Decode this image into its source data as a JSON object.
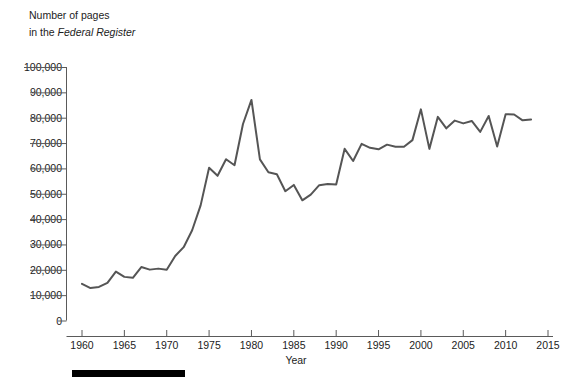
{
  "title": {
    "line1": "Number of pages",
    "line2_prefix": "in the ",
    "line2_italic": "Federal Register"
  },
  "axes": {
    "x_label": "Year",
    "x_ticks": [
      "1960",
      "1965",
      "1970",
      "1975",
      "1980",
      "1985",
      "1990",
      "1995",
      "2000",
      "2005",
      "2010",
      "2015"
    ],
    "y_ticks": [
      "100,000",
      "90,000",
      "80,000",
      "70,000",
      "60,000",
      "50,000",
      "40,000",
      "30,000",
      "20,000",
      "10,000",
      "0"
    ]
  },
  "colors": {
    "line": "#555555",
    "axis": "#5a5a5a",
    "text": "#1c1c1c",
    "rule_bar": "#000000",
    "background": "#ffffff"
  },
  "chart_data": {
    "type": "line",
    "title": "Number of pages in the Federal Register",
    "xlabel": "Year",
    "ylabel": "Number of pages in the Federal Register",
    "xlim": [
      1958.5,
      2015
    ],
    "ylim": [
      0,
      100000
    ],
    "grid": false,
    "legend": "none",
    "x": [
      1960,
      1961,
      1962,
      1963,
      1964,
      1965,
      1966,
      1967,
      1968,
      1969,
      1970,
      1971,
      1972,
      1973,
      1974,
      1975,
      1976,
      1977,
      1978,
      1979,
      1980,
      1981,
      1982,
      1983,
      1984,
      1985,
      1986,
      1987,
      1988,
      1989,
      1990,
      1991,
      1992,
      1993,
      1994,
      1995,
      1996,
      1997,
      1998,
      1999,
      2000,
      2001,
      2002,
      2003,
      2004,
      2005,
      2006,
      2007,
      2008,
      2009,
      2010,
      2011,
      2012,
      2013
    ],
    "series": [
      {
        "name": "Pages in the Federal Register",
        "values": [
          14479,
          12792,
          13226,
          14842,
          19304,
          17206,
          16850,
          21087,
          20068,
          20464,
          20036,
          25442,
          28924,
          35586,
          45422,
          60221,
          57072,
          63629,
          61261,
          77498,
          87012,
          63554,
          58494,
          57704,
          50998,
          53480,
          47418,
          49654,
          53376,
          53821,
          53618,
          67716,
          62928,
          69684,
          68107,
          67518,
          69368,
          68530,
          68571,
          71161,
          83294,
          67702,
          80332,
          75798,
          78851,
          77752,
          78724,
          74408,
          80700,
          68598,
          81405,
          81247,
          78961,
          79311
        ]
      }
    ],
    "annotations": [
      {
        "text": "peak 1980",
        "x": 1980,
        "y": 87012
      },
      {
        "text": "low 1986",
        "x": 1986,
        "y": 47418
      }
    ]
  }
}
